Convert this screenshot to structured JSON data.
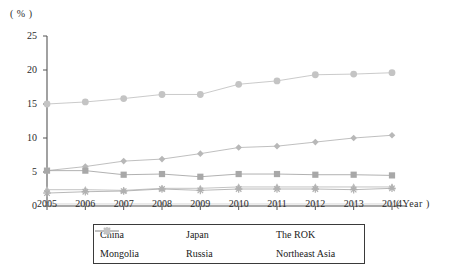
{
  "chart_data": {
    "type": "line",
    "title": "",
    "xlabel": "( Year )",
    "ylabel": "( % )",
    "x": [
      2005,
      2006,
      2007,
      2008,
      2009,
      2010,
      2011,
      2012,
      2013,
      2014
    ],
    "xtick_labels": [
      "2005",
      "2006",
      "2007",
      "2008",
      "2009",
      "2010",
      "2011",
      "2012",
      "2013",
      "2014"
    ],
    "ytick_labels": [
      "0",
      "5",
      "10",
      "15",
      "20",
      "25"
    ],
    "yticks": [
      0,
      5,
      10,
      15,
      20,
      25
    ],
    "ylim": [
      0,
      25
    ],
    "grid": false,
    "legend_position": "bottom",
    "series": [
      {
        "name": "China",
        "marker": "diamond",
        "color": "#b8b8b8",
        "values": [
          5.2,
          5.8,
          6.6,
          6.9,
          7.7,
          8.6,
          8.8,
          9.4,
          10.0,
          10.4
        ]
      },
      {
        "name": "Japan",
        "marker": "square",
        "color": "#a8a8a8",
        "values": [
          5.2,
          5.2,
          4.6,
          4.7,
          4.3,
          4.7,
          4.7,
          4.6,
          4.6,
          4.5
        ]
      },
      {
        "name": "The ROK",
        "marker": "triangle",
        "color": "#bdbdbd",
        "values": [
          2.4,
          2.4,
          2.3,
          2.6,
          2.6,
          2.8,
          2.8,
          2.8,
          2.8,
          2.8
        ]
      },
      {
        "name": "Mongolia",
        "marker": "cross",
        "color": "#d2d2d2",
        "values": [
          0.3,
          0.3,
          0.3,
          0.3,
          0.3,
          0.3,
          0.3,
          0.3,
          0.3,
          0.3
        ]
      },
      {
        "name": "Russia",
        "marker": "asterisk",
        "color": "#b0b0b0",
        "values": [
          1.9,
          2.1,
          2.2,
          2.5,
          2.3,
          2.5,
          2.5,
          2.5,
          2.4,
          2.6
        ]
      },
      {
        "name": "Northeast Asia",
        "marker": "circle",
        "color": "#c4c4c4",
        "values": [
          15.0,
          15.3,
          15.8,
          16.4,
          16.4,
          17.9,
          18.4,
          19.3,
          19.4,
          19.6
        ]
      }
    ]
  }
}
